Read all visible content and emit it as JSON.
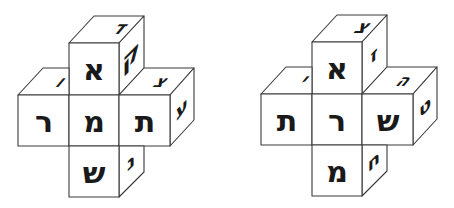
{
  "figure": {
    "colors": {
      "line": "#3a3a3a",
      "ink": "#1a1a1a",
      "background": "#ffffff"
    }
  },
  "clusters": [
    {
      "name": "left-cluster",
      "top_cube": {
        "front": "א",
        "top": "ד",
        "side": "ק"
      },
      "left_cube": {
        "front": "ר",
        "top": "ו"
      },
      "center_cube": {
        "front": "מ"
      },
      "right_cube": {
        "front": "ת",
        "top": "צ",
        "side": "ע"
      },
      "bottom_cube": {
        "front": "ש",
        "side": "נ"
      }
    },
    {
      "name": "right-cluster",
      "top_cube": {
        "front": "א",
        "top": "צ",
        "side": "ז"
      },
      "left_cube": {
        "front": "ת",
        "top": "י"
      },
      "center_cube": {
        "front": "ר"
      },
      "right_cube": {
        "front": "ש",
        "top": "ה",
        "side": "ט"
      },
      "bottom_cube": {
        "front": "מ",
        "side": "ח"
      }
    }
  ]
}
